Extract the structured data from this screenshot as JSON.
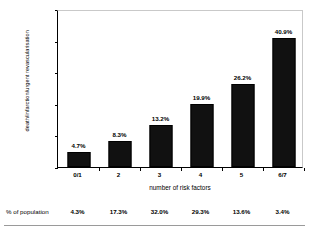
{
  "chart_data": {
    "type": "bar",
    "title": "",
    "xlabel": "number of risk factors",
    "ylabel": "death/infarction/urgent revascularisation",
    "categories": [
      "0/1",
      "2",
      "3",
      "4",
      "5",
      "6/7"
    ],
    "values": [
      4.7,
      8.3,
      13.2,
      19.9,
      26.2,
      40.9
    ],
    "value_labels": [
      "4.7%",
      "8.3%",
      "13.2%",
      "19.9%",
      "26.2%",
      "40.9%"
    ],
    "ylim": [
      0,
      50
    ],
    "yticks": [
      0,
      10,
      20,
      30,
      40,
      50
    ],
    "ytick_labels": [
      "0%",
      "10%",
      "20%",
      "30%",
      "40%",
      "50%"
    ],
    "grid": false,
    "legend": false,
    "bar_color": "#111111",
    "series": [
      {
        "name": "death/infarction/urgent revascularisation",
        "values": [
          4.7,
          8.3,
          13.2,
          19.9,
          26.2,
          40.9
        ]
      }
    ]
  },
  "footer": {
    "row_label": "% of population",
    "values": [
      "4.3%",
      "17.3%",
      "32.0%",
      "29.3%",
      "13.6%",
      "3.4%"
    ]
  }
}
